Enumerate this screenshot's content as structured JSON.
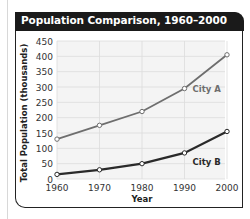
{
  "title": "Population Comparison, 1960–2000",
  "chart_data": {
    "type": "line",
    "title": "Population Comparison, 1960–2000",
    "xlabel": "Year",
    "ylabel": "Total Population (thousands)",
    "x": [
      1960,
      1970,
      1980,
      1990,
      2000
    ],
    "x_tick_labels": [
      "1960",
      "1970",
      "1980",
      "1990",
      "2000"
    ],
    "y_tick_labels": [
      "0",
      "50",
      "100",
      "150",
      "200",
      "250",
      "300",
      "350",
      "400",
      "450"
    ],
    "ylim": [
      0,
      450
    ],
    "grid": true,
    "legend": "inline labels",
    "series": [
      {
        "name": "City A",
        "values": [
          130,
          175,
          220,
          295,
          405
        ],
        "color": "#6e6e6e"
      },
      {
        "name": "City B",
        "values": [
          15,
          30,
          50,
          85,
          155
        ],
        "color": "#2a2a2a"
      }
    ]
  }
}
